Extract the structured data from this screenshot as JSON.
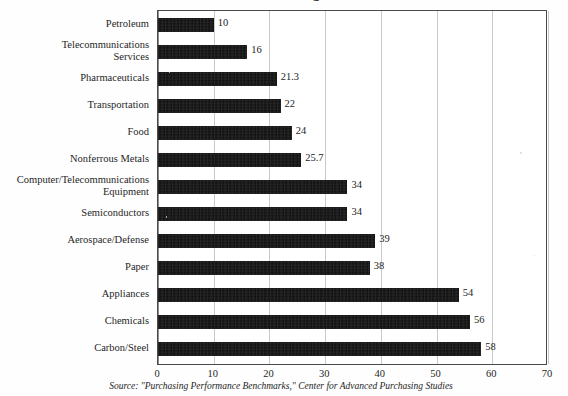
{
  "figure": {
    "title_remnant": "Purchasing",
    "source_note": "Source: \"Purchasing Performance Benchmarks,\" Center for Advanced Purchasing Studies"
  },
  "axis": {
    "x_ticks": [
      "0",
      "10",
      "20",
      "30",
      "40",
      "50",
      "60",
      "70"
    ],
    "x_min": 0,
    "x_max": 70,
    "x_step": 10
  },
  "colors": {
    "bar": "#0d0d0d",
    "grid": "#c9c9c9",
    "frame": "#4a4a4a",
    "text": "#1f1f1f",
    "background": "#ffffff"
  },
  "chart_data": {
    "type": "bar",
    "orientation": "horizontal",
    "title": "Purchasing",
    "xlabel": "",
    "ylabel": "",
    "xlim": [
      0,
      70
    ],
    "grid": true,
    "legend": "none",
    "source": "Source: \"Purchasing Performance Benchmarks,\" Center for Advanced Purchasing Studies",
    "categories": [
      "Petroleum",
      "Telecommunications\nServices",
      "Pharmaceuticals",
      "Transportation",
      "Food",
      "Nonferrous Metals",
      "Computer/Telecommunications\nEquipment",
      "Semiconductors",
      "Aerospace/Defense",
      "Paper",
      "Appliances",
      "Chemicals",
      "Carbon/Steel"
    ],
    "values": [
      10,
      16,
      21.3,
      22,
      24,
      25.7,
      34,
      34,
      39,
      38,
      54,
      56,
      58
    ],
    "value_labels": [
      "10",
      "16",
      "21.3",
      "22",
      "24",
      "25.7",
      "34",
      "34",
      "39",
      "38",
      "54",
      "56",
      "58"
    ]
  }
}
